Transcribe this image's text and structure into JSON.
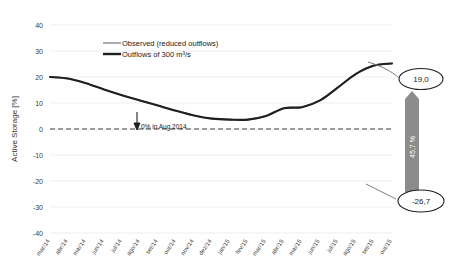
{
  "chart_data": {
    "type": "line",
    "title": "",
    "xlabel": "",
    "ylabel": "Active Storage [%]",
    "ylim": [
      -40,
      40
    ],
    "ytick_labels": [
      "40",
      "30",
      "20",
      "10",
      "0",
      "-10",
      "-20",
      "-30",
      "-40"
    ],
    "ytick_values": [
      40,
      30,
      20,
      10,
      0,
      -10,
      -20,
      -30,
      -40
    ],
    "grid": true,
    "legend_position": "top-center",
    "categories": [
      "mar/14",
      "abr/14",
      "mai/14",
      "jun/14",
      "jul/14",
      "ago/14",
      "set/14",
      "out/14",
      "nov/14",
      "dez/14",
      "jan/15",
      "fev/15",
      "mar/15",
      "abr/15",
      "mai/15",
      "jun/15",
      "jul/15",
      "ago/15",
      "set/15",
      "out/15"
    ],
    "series": [
      {
        "name": "Observed (reduced outflows)",
        "color": "#9d9d9d",
        "values": [
          20.0,
          19.4,
          17.6,
          15.2,
          13.0,
          11.0,
          9.0,
          7.0,
          5.2,
          4.0,
          3.6,
          3.6,
          5.0,
          8.0,
          8.4,
          11.0,
          16.0,
          21.2,
          24.4,
          25.2
        ]
      },
      {
        "name": "Outflows of 300 m³/s",
        "color": "#1f1f1f",
        "values": [
          20.0,
          18.2,
          15.2,
          12.0,
          8.2,
          4.6,
          0.4,
          -3.8,
          -7.6,
          -11.0,
          -14.4,
          -16.8,
          -18.6,
          -18.2,
          -17.0,
          -17.6,
          -19.0,
          -16.2,
          -15.2,
          -16.0
        ]
      }
    ],
    "annotations": [
      {
        "name": "zero-crossing",
        "text": "0% in Aug 2014"
      },
      {
        "name": "top-callout",
        "text": "19,0"
      },
      {
        "name": "bottom-callout",
        "text": "-26,7"
      },
      {
        "name": "difference-arrow",
        "text": "45,7 %"
      }
    ]
  },
  "legend": {
    "items": [
      {
        "label": "Observed (reduced outflows)",
        "color": "#9d9d9d"
      },
      {
        "label": "Outflows of 300 m³/s",
        "color": "#1f1f1f"
      }
    ]
  },
  "axis": {
    "y_title": "Active Storage [%]",
    "y_ticks": [
      "40",
      "30",
      "20",
      "10",
      "0",
      "-10",
      "-20",
      "-30",
      "-40"
    ],
    "x_ticks": [
      "mar/14",
      "abr/14",
      "mai/14",
      "jun/14",
      "jul/14",
      "ago/14",
      "set/14",
      "out/14",
      "nov/14",
      "dez/14",
      "jan/15",
      "fev/15",
      "mar/15",
      "abr/15",
      "mai/15",
      "jun/15",
      "jul/15",
      "ago/15",
      "set/15",
      "out/15"
    ]
  },
  "annotations": {
    "zero_crossing": "0% in Aug 2014",
    "top_callout": "19,0",
    "bottom_callout": "-26,7",
    "difference": "45,7 %"
  },
  "colors": {
    "observed": "#9d9d9d",
    "outflow": "#1f1f1f",
    "arrow": "#8c8c8c",
    "grid": "#e3e7ea"
  }
}
